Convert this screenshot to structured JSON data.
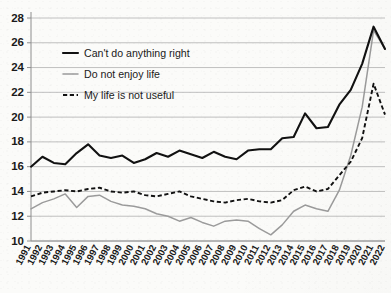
{
  "chart_data": {
    "type": "line",
    "title": "",
    "subtitle": "",
    "xlabel": "",
    "ylabel": "",
    "ylim": [
      10,
      28
    ],
    "yticks": [
      10,
      12,
      14,
      16,
      18,
      20,
      22,
      24,
      26,
      28
    ],
    "grid": "horizontal",
    "legend_position": "upper-left-inside",
    "x": [
      1991,
      1992,
      1993,
      1994,
      1995,
      1996,
      1997,
      1998,
      1999,
      2000,
      2001,
      2002,
      2003,
      2004,
      2005,
      2006,
      2007,
      2008,
      2009,
      2010,
      2011,
      2012,
      2013,
      2014,
      2015,
      2016,
      2017,
      2018,
      2019,
      2020,
      2021,
      2022
    ],
    "categories": [
      "1991",
      "1992",
      "1993",
      "1994",
      "1995",
      "1996",
      "1997",
      "1998",
      "1999",
      "2000",
      "2001",
      "2002",
      "2003",
      "2004",
      "2005",
      "2006",
      "2007",
      "2008",
      "2009",
      "2010",
      "2011",
      "2012",
      "2013",
      "2014",
      "2015",
      "2016",
      "2017",
      "2018",
      "2019",
      "2020",
      "2021",
      "2022"
    ],
    "series": [
      {
        "name": "Can't do anything right",
        "style": "solid",
        "color": "#111111",
        "values": [
          16.0,
          16.8,
          16.3,
          16.2,
          17.1,
          17.8,
          16.9,
          16.7,
          16.9,
          16.3,
          16.6,
          17.1,
          16.8,
          17.3,
          17.0,
          16.7,
          17.2,
          16.8,
          16.6,
          17.3,
          17.4,
          17.4,
          18.3,
          18.4,
          20.3,
          19.1,
          19.2,
          21.0,
          22.2,
          24.3,
          27.3,
          25.5
        ]
      },
      {
        "name": "Do not enjoy life",
        "style": "solid-gray",
        "color": "#9b9b9b",
        "values": [
          12.6,
          13.1,
          13.4,
          13.8,
          12.7,
          13.6,
          13.7,
          13.2,
          12.9,
          12.8,
          12.6,
          12.2,
          12.0,
          11.6,
          11.9,
          11.5,
          11.2,
          11.6,
          11.7,
          11.6,
          11.0,
          10.5,
          11.3,
          12.4,
          12.9,
          12.6,
          12.4,
          14.1,
          16.9,
          20.8,
          27.0,
          25.5
        ]
      },
      {
        "name": "My life is not useful",
        "style": "dashed",
        "color": "#111111",
        "values": [
          13.6,
          13.9,
          14.0,
          14.1,
          14.0,
          14.2,
          14.3,
          14.0,
          13.9,
          14.0,
          13.7,
          13.6,
          13.8,
          14.0,
          13.6,
          13.4,
          13.2,
          13.1,
          13.3,
          13.4,
          13.2,
          13.1,
          13.3,
          14.1,
          14.4,
          14.0,
          14.2,
          15.3,
          16.4,
          18.3,
          22.7,
          20.2
        ]
      }
    ],
    "legend": [
      {
        "label": "Can't do anything right",
        "style": "solid",
        "color": "#111111"
      },
      {
        "label": "Do not enjoy life",
        "style": "solid-gray",
        "color": "#9b9b9b"
      },
      {
        "label": "My life is not useful",
        "style": "dashed",
        "color": "#111111"
      }
    ]
  }
}
